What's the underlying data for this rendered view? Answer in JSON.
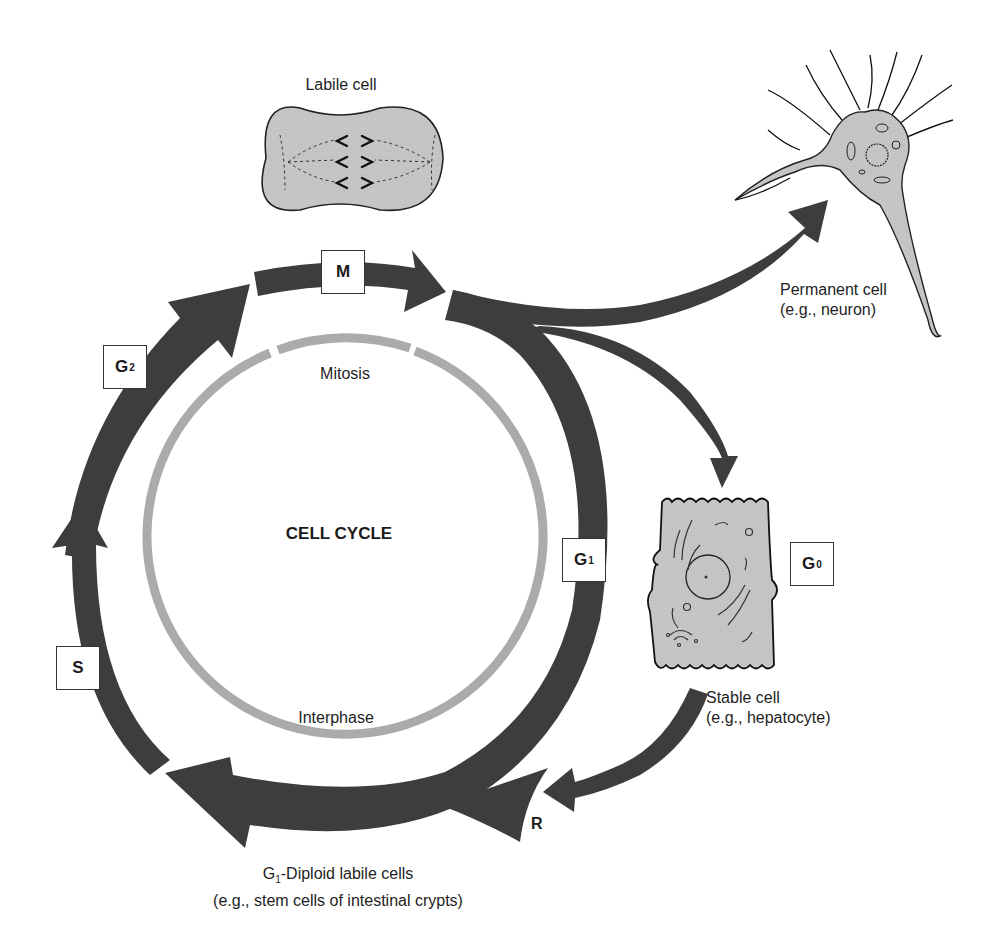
{
  "diagram": {
    "title": "CELL CYCLE",
    "inner_ring": {
      "top_label": "Mitosis",
      "bottom_label": "Interphase",
      "color": "#ababab"
    },
    "outer_ring": {
      "color": "#3d3d3d",
      "phases": [
        {
          "id": "M",
          "letter": "M",
          "subscript": ""
        },
        {
          "id": "G2",
          "letter": "G",
          "subscript": "2"
        },
        {
          "id": "S",
          "letter": "S",
          "subscript": ""
        },
        {
          "id": "G1",
          "letter": "G",
          "subscript": "1"
        }
      ],
      "restriction_point": "R"
    },
    "g0_box": {
      "letter": "G",
      "subscript": "0"
    },
    "cells": {
      "labile": {
        "label": "Labile cell",
        "fill": "#c9c9c9"
      },
      "permanent": {
        "line1": "Permanent cell",
        "line2": "(e.g., neuron)",
        "fill": "#c9c9c9"
      },
      "stable": {
        "line1": "Stable cell",
        "line2": "(e.g., hepatocyte)",
        "fill": "#c9c9c9"
      }
    },
    "bottom_caption": {
      "line1_prefix": "G",
      "line1_sub": "1",
      "line1_rest": "-Diploid labile cells",
      "line2": "(e.g., stem cells of intestinal crypts)"
    }
  }
}
